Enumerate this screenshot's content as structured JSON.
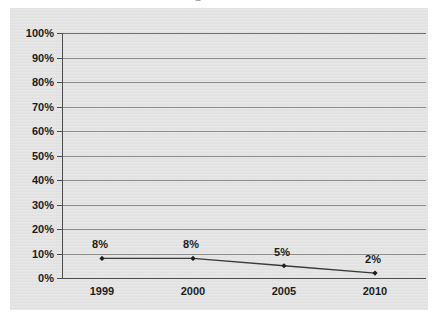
{
  "chart_data": {
    "type": "line",
    "title": "",
    "xlabel": "",
    "ylabel": "",
    "categories": [
      "1999",
      "2000",
      "2005",
      "2010"
    ],
    "values": [
      8,
      8,
      5,
      2
    ],
    "point_labels": [
      "8%",
      "8%",
      "5%",
      "2%"
    ],
    "ylim": [
      0,
      100
    ],
    "ytick_labels": [
      "100%",
      "90%",
      "80%",
      "70%",
      "60%",
      "50%",
      "40%",
      "30%",
      "20%",
      "10%",
      "0%"
    ],
    "ytick_values": [
      100,
      90,
      80,
      70,
      60,
      50,
      40,
      30,
      20,
      10,
      0
    ],
    "grid": true,
    "legend": false,
    "series": [
      {
        "name": "",
        "values": [
          8,
          8,
          5,
          2
        ]
      }
    ],
    "marker": "diamond",
    "colors": {
      "panel_background": "#e3e3e3",
      "gridline": "#8e8e8e",
      "axis": "#4d4d4d",
      "series_line": "#3a3a3a",
      "marker": "#1c1c1c",
      "text": "#1c1c1c",
      "page_background": "#ffffff"
    }
  },
  "title_fragment": "p"
}
